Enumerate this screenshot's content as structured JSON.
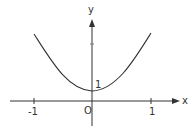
{
  "figure": {
    "type": "function-graph",
    "curve_description": "U-shaped curve symmetric about the y-axis with minimum value 1 at x = 0",
    "axes": {
      "x_label": "x",
      "y_label": "y",
      "origin_label": "O"
    },
    "ticks": {
      "x_neg": "-1",
      "x_pos": "1",
      "y_intercept": "1"
    },
    "colors": {
      "line": "#333333",
      "background": "#ffffff"
    }
  }
}
